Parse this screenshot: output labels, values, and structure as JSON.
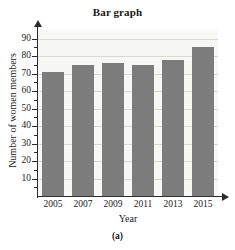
{
  "figure": {
    "label": "(a)"
  },
  "chart_data": {
    "type": "bar",
    "title": "Bar graph",
    "xlabel": "Year",
    "ylabel": "Number of women members",
    "categories": [
      "2005",
      "2007",
      "2009",
      "2011",
      "2013",
      "2015"
    ],
    "values": [
      71,
      75,
      76,
      75,
      78,
      85
    ],
    "ylim": [
      0,
      95
    ],
    "ytick_labels": [
      "10",
      "20",
      "30",
      "40",
      "50",
      "60",
      "70",
      "80",
      "90"
    ],
    "ytick_values": [
      10,
      20,
      30,
      40,
      50,
      60,
      70,
      80,
      90
    ],
    "yminor_ticks": [
      5,
      15,
      25,
      35,
      45,
      55,
      65,
      75,
      85
    ],
    "grid": true,
    "grid_axis": "y",
    "legend": null,
    "bar_color": "#7c7c7c",
    "plot_background": "#f7f7f5",
    "axis_color": "#2b2b2b",
    "grid_color": "#d9d9d6"
  }
}
